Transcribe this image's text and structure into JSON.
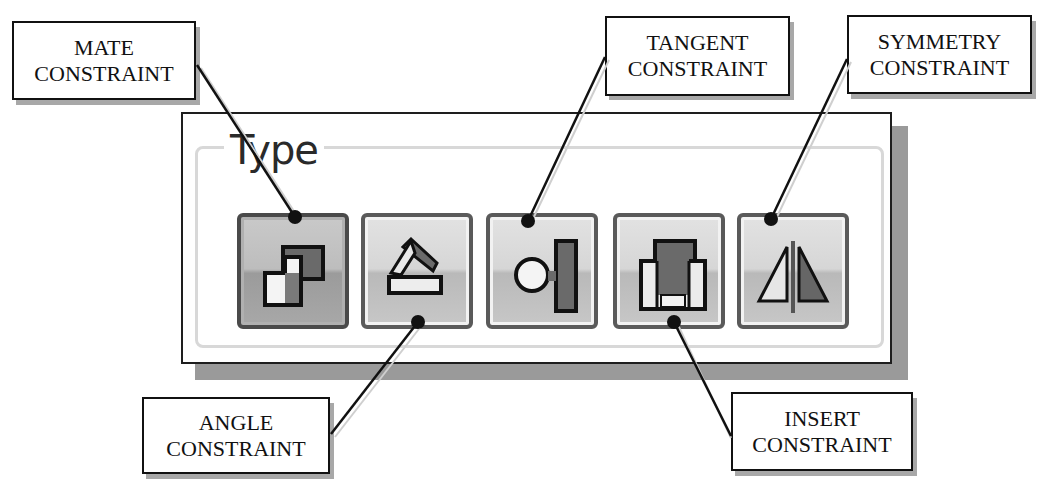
{
  "panel": {
    "group_title": "Type",
    "buttons": [
      {
        "id": "mate",
        "icon": "mate-constraint-icon",
        "active": true
      },
      {
        "id": "angle",
        "icon": "angle-constraint-icon",
        "active": false
      },
      {
        "id": "tangent",
        "icon": "tangent-constraint-icon",
        "active": false
      },
      {
        "id": "insert",
        "icon": "insert-constraint-icon",
        "active": false
      },
      {
        "id": "symmetry",
        "icon": "symmetry-constraint-icon",
        "active": false
      }
    ]
  },
  "callouts": {
    "mate": {
      "line1": "MATE",
      "line2": "CONSTRAINT"
    },
    "tangent": {
      "line1": "TANGENT",
      "line2": "CONSTRAINT"
    },
    "symmetry": {
      "line1": "SYMMETRY",
      "line2": "CONSTRAINT"
    },
    "angle": {
      "line1": "ANGLE",
      "line2": "CONSTRAINT"
    },
    "insert": {
      "line1": "INSERT",
      "line2": "CONSTRAINT"
    }
  },
  "colors": {
    "button_border": "#5a5a5a",
    "icon_dark": "#5c5c5c",
    "icon_outline": "#111111",
    "leader_line": "#111111"
  }
}
